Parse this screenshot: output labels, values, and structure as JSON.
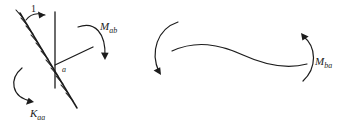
{
  "figure": {
    "kind": "engineering-sketch",
    "background_color": "#ffffff",
    "ink_color": "#1c1c1c",
    "left_panel": {
      "name": "unit-rotation-joint-diagram",
      "unit_load_label": "1",
      "node_label": "a",
      "stiffness_label": {
        "base": "K",
        "subscript": "aa"
      },
      "carryover_label": {
        "base": "M",
        "subscript": "ab"
      }
    },
    "right_panel": {
      "name": "deflected-member-diagram",
      "end_moment_label": {
        "base": "M",
        "subscript": "ba"
      }
    }
  }
}
